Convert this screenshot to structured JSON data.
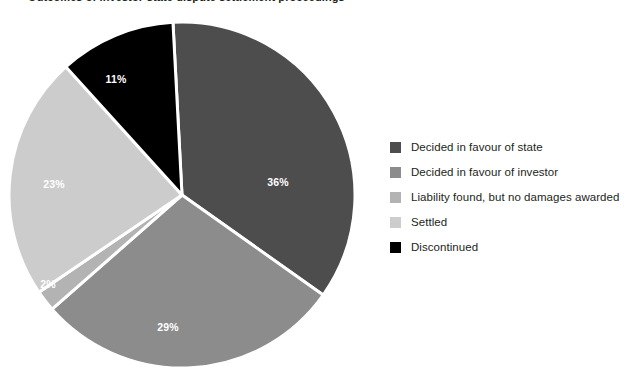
{
  "chart_data": {
    "type": "pie",
    "title": "Outcomes of investor-state dispute settlement proceedings",
    "categories": [
      "Decided in favour of state",
      "Decided in favour of investor",
      "Liability found, but no damages awarded",
      "Settled",
      "Discontinued"
    ],
    "values": [
      36,
      29,
      2,
      23,
      11
    ],
    "value_labels": [
      "36%",
      "29%",
      "2%",
      "23%",
      "11%"
    ],
    "colors": [
      "#4d4d4d",
      "#8c8c8c",
      "#b3b3b3",
      "#cccccc",
      "#000000"
    ],
    "slice_label_color": "#ffffff",
    "separator_color": "#ffffff",
    "legend_position": "right",
    "grid": false,
    "xlabel": "",
    "ylabel": "",
    "start_angle_deg": -3,
    "direction": "clockwise",
    "slices": [
      {
        "name": "Decided in favour of state",
        "label": "36%",
        "value": 36,
        "color": "#4d4d4d",
        "label_x": 278,
        "label_y": 173
      },
      {
        "name": "Decided in favour of investor",
        "label": "29%",
        "value": 29,
        "color": "#8c8c8c",
        "label_x": 168,
        "label_y": 318
      },
      {
        "name": "Liability found, but no damages awarded",
        "label": "2%",
        "value": 2,
        "color": "#b3b3b3",
        "label_x": 48,
        "label_y": 275
      },
      {
        "name": "Settled",
        "label": "23%",
        "value": 23,
        "color": "#cccccc",
        "label_x": 54,
        "label_y": 175
      },
      {
        "name": "Discontinued",
        "label": "11%",
        "value": 11,
        "color": "#000000",
        "label_x": 116,
        "label_y": 70
      }
    ]
  },
  "legend": {
    "items": [
      {
        "label": "Decided in favour of state",
        "color": "#4d4d4d"
      },
      {
        "label": "Decided in favour of investor",
        "color": "#8c8c8c"
      },
      {
        "label": "Liability found, but no damages awarded",
        "color": "#b3b3b3"
      },
      {
        "label": "Settled",
        "color": "#cccccc"
      },
      {
        "label": "Discontinued",
        "color": "#000000"
      }
    ]
  }
}
